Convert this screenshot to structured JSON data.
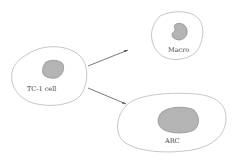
{
  "diagram": {
    "cells": [
      {
        "id": "tc1",
        "label": "TC-1 cell"
      },
      {
        "id": "macro",
        "label": "Macro"
      },
      {
        "id": "arc",
        "label": "ARC"
      }
    ],
    "arrows": [
      {
        "from": "tc1",
        "to": "macro"
      },
      {
        "from": "tc1",
        "to": "arc"
      }
    ],
    "colors": {
      "outline": "#b8b8b8",
      "nucleus_fill": "#b4b4b4",
      "nucleus_stroke": "#8a8a8a",
      "arrow": "#555555",
      "text": "#444444"
    }
  }
}
